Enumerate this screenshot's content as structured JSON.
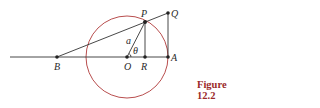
{
  "figure": {
    "caption": "Figure 12.2",
    "caption_color": "#9b2a2a",
    "circle_color": "#b03a3a",
    "line_color": "#333333",
    "points": {
      "P": "P",
      "Q": "Q",
      "A": "A",
      "B": "B",
      "O": "O",
      "R": "R"
    },
    "labels": {
      "radius": "a",
      "angle": "θ"
    }
  }
}
